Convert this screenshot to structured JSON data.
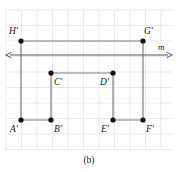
{
  "figure": {
    "caption": "(b)",
    "width": 178,
    "height": 172,
    "background": "#ffffff"
  },
  "chart_data": {
    "type": "scatter",
    "title": "(b)",
    "xlabel": "",
    "ylabel": "",
    "grid": true,
    "grid_spacing": 15.5,
    "grid_color": "#e9e9ee",
    "plot_area": {
      "x0": 6,
      "y0": 10,
      "x1": 172,
      "y1": 150
    },
    "point_color": "#111111",
    "segment_color": "#7d7d85",
    "axis_color": "#55555d",
    "points": [
      {
        "name": "H'",
        "x": 21,
        "y": 41,
        "label_dx": -12,
        "label_dy": -14
      },
      {
        "name": "G'",
        "x": 143,
        "y": 41,
        "label_dx": 1,
        "label_dy": -14
      },
      {
        "name": "C'",
        "x": 51,
        "y": 73,
        "label_dx": 3,
        "label_dy": 5
      },
      {
        "name": "D'",
        "x": 113,
        "y": 73,
        "label_dx": -13,
        "label_dy": 5
      },
      {
        "name": "A'",
        "x": 21,
        "y": 120,
        "label_dx": -11,
        "label_dy": 5
      },
      {
        "name": "B'",
        "x": 51,
        "y": 120,
        "label_dx": 3,
        "label_dy": 5
      },
      {
        "name": "E'",
        "x": 113,
        "y": 120,
        "label_dx": -12,
        "label_dy": 5
      },
      {
        "name": "F'",
        "x": 143,
        "y": 120,
        "label_dx": 3,
        "label_dy": 5
      }
    ],
    "segments": [
      {
        "name": "H'G'",
        "x1": 21,
        "y1": 41,
        "x2": 143,
        "y2": 41
      },
      {
        "name": "H'A'",
        "x1": 21,
        "y1": 41,
        "x2": 21,
        "y2": 120
      },
      {
        "name": "G'F'",
        "x1": 143,
        "y1": 41,
        "x2": 143,
        "y2": 120
      },
      {
        "name": "A'B'",
        "x1": 21,
        "y1": 120,
        "x2": 51,
        "y2": 120
      },
      {
        "name": "B'C'",
        "x1": 51,
        "y1": 120,
        "x2": 51,
        "y2": 73
      },
      {
        "name": "C'D'",
        "x1": 51,
        "y1": 73,
        "x2": 113,
        "y2": 73
      },
      {
        "name": "D'E'",
        "x1": 113,
        "y1": 73,
        "x2": 113,
        "y2": 120
      },
      {
        "name": "E'F'",
        "x1": 113,
        "y1": 120,
        "x2": 143,
        "y2": 120
      }
    ],
    "mirror_line": {
      "name": "m",
      "label": "m",
      "y": 55,
      "x_start": 6,
      "x_end": 172,
      "label_x": 158,
      "label_y": 43,
      "arrows": "both"
    }
  }
}
